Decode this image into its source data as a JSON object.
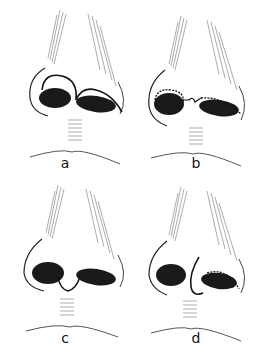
{
  "figure": {
    "panels": [
      {
        "id": "a",
        "label": "a",
        "incision": "Arched line across columella-tip joining both alar rims (transcolumellar rim incision)"
      },
      {
        "id": "b",
        "label": "b",
        "incision": "Dotted marginal incisions along both alar rims joined by a short columellar step line"
      },
      {
        "id": "c",
        "label": "c",
        "incision": "U-shaped line across base of columella connecting both nostrils"
      },
      {
        "id": "d",
        "label": "d",
        "incision": "Vertical curved line on columella with dotted marginal incision in right nostril"
      }
    ],
    "caption": ""
  },
  "colors": {
    "ink": "#111111",
    "hatching": "#777777",
    "background": "#ffffff"
  }
}
